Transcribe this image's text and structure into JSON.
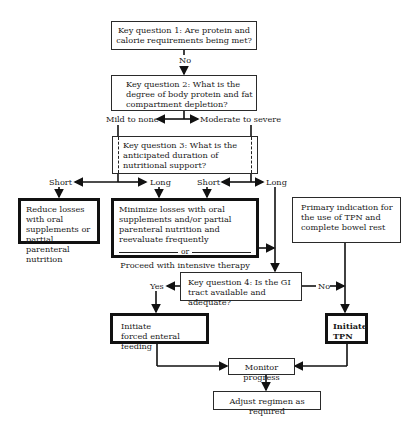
{
  "diagram": {
    "nodes": {
      "kq1": "Key question 1: Are protein and calorie requirements being met?",
      "kq2": "Key question 2: What is the degree of body protein and fat compartment depletion?",
      "kq3": "Key question 3: What is the anticipated duration of nutritional support?",
      "reduce": "Reduce losses with oral supplements or partial parenteral nutrition",
      "minimize": "Minimize losses with oral supplements and/or partial parenteral nutrition and reevaluate frequently",
      "or": "or",
      "proceed": "Proceed with intensive therapy",
      "primary": "Primary indication for the use of TPN and complete bowel rest",
      "kq4": "Key question 4: Is the GI tract available and adequate?",
      "enteral": "Initiate forced enteral feeding",
      "enteral_l1": "Initiate",
      "enteral_l2": "forced enteral feeding",
      "tpn_l1": "Initiate",
      "tpn_l2": "TPN",
      "monitor": "Monitor progress",
      "adjust": "Adjust regimen as required"
    },
    "labels": {
      "no1": "No",
      "mild": "Mild to none",
      "moderate": "Moderate to severe",
      "short_left": "Short",
      "long_left": "Long",
      "short_right": "Short",
      "long_right": "Long",
      "yes": "Yes",
      "no2": "No"
    },
    "colors": {
      "line": "#1a1a1a",
      "background": "#ffffff"
    }
  }
}
